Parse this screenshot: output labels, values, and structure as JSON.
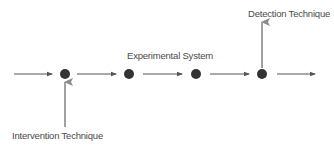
{
  "diagram": {
    "labels": {
      "system": "Experimental System",
      "intervention": "Intervention Technique",
      "detection": "Detection Technique"
    },
    "colors": {
      "node": "#333333",
      "flow_arrow": "#555555",
      "technique_arrow": "#8a8a8a",
      "text": "#4a4a4a"
    },
    "nodes": [
      {
        "id": "node-1",
        "x": 65,
        "y": 74
      },
      {
        "id": "node-2",
        "x": 129,
        "y": 74
      },
      {
        "id": "node-3",
        "x": 196,
        "y": 74
      },
      {
        "id": "node-4",
        "x": 262,
        "y": 74
      }
    ],
    "flow_arrows": [
      {
        "from": "start",
        "to": "node-1"
      },
      {
        "from": "node-1",
        "to": "node-2"
      },
      {
        "from": "node-2",
        "to": "node-3"
      },
      {
        "from": "node-3",
        "to": "node-4"
      },
      {
        "from": "node-4",
        "to": "end"
      }
    ],
    "technique_arrows": [
      {
        "label": "Intervention Technique",
        "target": "node-1",
        "direction": "up-into-node"
      },
      {
        "label": "Detection Technique",
        "target": "node-4",
        "direction": "up-out-of-node"
      }
    ]
  }
}
